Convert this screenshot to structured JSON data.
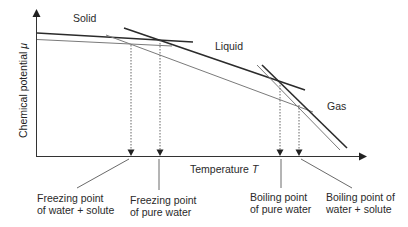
{
  "diagram": {
    "type": "chemical-potential-vs-temperature",
    "axes": {
      "y_label": "Chemical potential",
      "y_symbol": "μ",
      "x_label": "Temperature",
      "x_symbol": "T"
    },
    "phases": {
      "solid": "Solid",
      "liquid": "Liquid",
      "gas": "Gas"
    },
    "annotations": {
      "freezing_solute": {
        "line1": "Freezing point",
        "line2": "of water + solute"
      },
      "freezing_pure": {
        "line1": "Freezing point",
        "line2": "of pure water"
      },
      "boiling_pure": {
        "line1": "Boiling point",
        "line2": "of pure water"
      },
      "boiling_solute": {
        "line1": "Boiling point of",
        "line2": "water + solute"
      }
    },
    "colors": {
      "thick_line": "#2b2b2b",
      "thin_line": "#7a7a7a",
      "axis": "#333333"
    }
  }
}
